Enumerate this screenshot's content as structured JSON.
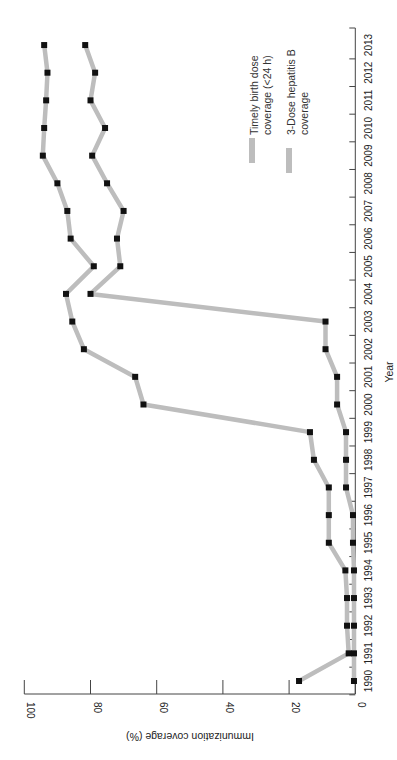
{
  "chart_data": {
    "type": "line",
    "orientation": "rotated-90-ccw",
    "title": "",
    "xlabel": "Year",
    "ylabel": "Immunization coverage (%)",
    "ylim": [
      0,
      100
    ],
    "yticks": [
      0,
      20,
      40,
      60,
      80,
      100
    ],
    "x": [
      1990,
      1991,
      1992,
      1993,
      1994,
      1995,
      1996,
      1997,
      1998,
      1999,
      2000,
      2001,
      2002,
      2003,
      2004,
      2005,
      2006,
      2007,
      2008,
      2009,
      2010,
      2011,
      2012,
      2013
    ],
    "grid": false,
    "legend_position": "upper-left (in rotated frame)",
    "series": [
      {
        "name": "Timely birth dose coverage (<24 h)",
        "color": "#bdbdbd",
        "marker_color": "#111111",
        "values": [
          0.4,
          0.4,
          0.4,
          0.4,
          0.4,
          0.7,
          0.7,
          2.8,
          2.8,
          2.8,
          5.5,
          5.5,
          9,
          9,
          80,
          71,
          72,
          70,
          75,
          79.5,
          75.6,
          80,
          78.6,
          81.6
        ]
      },
      {
        "name": "3-Dose hepatitis B coverage",
        "color": "#bdbdbd",
        "marker_color": "#111111",
        "values": [
          17,
          2,
          2.5,
          2.5,
          3,
          8,
          8,
          8,
          12.5,
          13.7,
          64,
          66.5,
          82,
          85.5,
          87.4,
          79,
          86,
          87,
          90,
          94.4,
          94,
          93.4,
          93,
          94
        ]
      }
    ]
  },
  "legend": {
    "items": [
      {
        "line1": "Timely birth dose",
        "line2": "coverage (<24 h)"
      },
      {
        "line1": "3-Dose hepatitis B",
        "line2": "coverage"
      }
    ]
  },
  "axes": {
    "x_title": "Year",
    "y_title": "Immunization coverage (%)"
  }
}
